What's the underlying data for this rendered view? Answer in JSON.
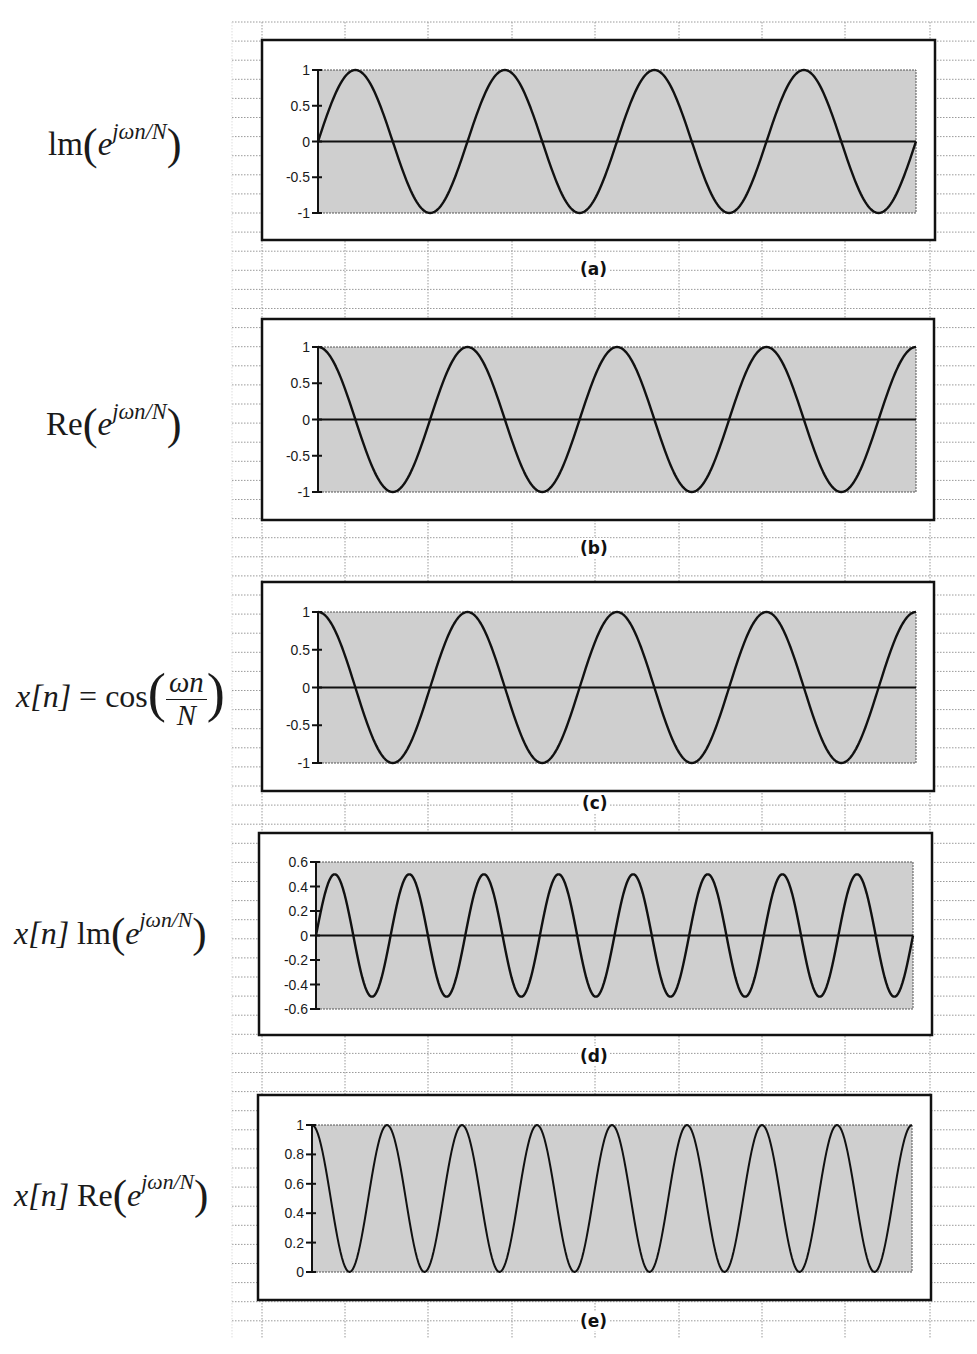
{
  "figure": {
    "background": "spreadsheet-grid",
    "colors": {
      "plot_fill": "#cfcfcf",
      "line": "#111111",
      "frame": "#111111",
      "grid": "#9a9a9a"
    }
  },
  "panels": [
    {
      "id": "a",
      "panel_label": "(a)",
      "formula": {
        "prefix": "",
        "func": "lm",
        "base": "e",
        "exponent": "jωn/N"
      },
      "yticks": [
        "1",
        "0.5",
        "0",
        "-0.5",
        "-1"
      ]
    },
    {
      "id": "b",
      "panel_label": "(b)",
      "formula": {
        "prefix": "",
        "func": "Re",
        "base": "e",
        "exponent": "jωn/N"
      },
      "yticks": [
        "1",
        "0.5",
        "0",
        "-0.5",
        "-1"
      ]
    },
    {
      "id": "c",
      "panel_label": "(c)",
      "formula": {
        "lhs": "x[n]",
        "eq": "=",
        "func": "cos",
        "num": "ωn",
        "den": "N"
      },
      "yticks": [
        "1",
        "0.5",
        "0",
        "-0.5",
        "-1"
      ]
    },
    {
      "id": "d",
      "panel_label": "(d)",
      "formula": {
        "prefix": "x[n]",
        "func": "lm",
        "base": "e",
        "exponent": "jωn/N"
      },
      "yticks": [
        "0.6",
        "0.4",
        "0.2",
        "0",
        "-0.2",
        "-0.4",
        "-0.6"
      ]
    },
    {
      "id": "e",
      "panel_label": "(e)",
      "formula": {
        "prefix": "x[n]",
        "func": "Re",
        "base": "e",
        "exponent": "jωn/N"
      },
      "yticks": [
        "1",
        "0.8",
        "0.6",
        "0.4",
        "0.2",
        "0"
      ]
    }
  ],
  "chart_data": [
    {
      "type": "line",
      "title": "(a)",
      "ylabel": "Im(e^{jωn/N})",
      "xlabel": "",
      "function": "sin",
      "cycles": 4,
      "amplitude": 1,
      "offset": 0,
      "ylim": [
        -1,
        1
      ],
      "yticks": [
        1,
        0.5,
        0,
        -0.5,
        -1
      ],
      "zero_line": true,
      "grid": false
    },
    {
      "type": "line",
      "title": "(b)",
      "ylabel": "Re(e^{jωn/N})",
      "xlabel": "",
      "function": "cos",
      "cycles": 4,
      "amplitude": 1,
      "offset": 0,
      "ylim": [
        -1,
        1
      ],
      "yticks": [
        1,
        0.5,
        0,
        -0.5,
        -1
      ],
      "zero_line": true,
      "grid": false
    },
    {
      "type": "line",
      "title": "(c)",
      "ylabel": "x[n] = cos(ωn/N)",
      "xlabel": "",
      "function": "cos",
      "cycles": 4,
      "amplitude": 1,
      "offset": 0,
      "ylim": [
        -1,
        1
      ],
      "yticks": [
        1,
        0.5,
        0,
        -0.5,
        -1
      ],
      "zero_line": true,
      "grid": false
    },
    {
      "type": "line",
      "title": "(d)",
      "ylabel": "x[n] Im(e^{jωn/N})",
      "xlabel": "",
      "function": "sin",
      "cycles": 8,
      "amplitude": 0.5,
      "offset": 0,
      "ylim": [
        -0.6,
        0.6
      ],
      "yticks": [
        0.6,
        0.4,
        0.2,
        0,
        -0.2,
        -0.4,
        -0.6
      ],
      "zero_line": true,
      "grid": false
    },
    {
      "type": "line",
      "title": "(e)",
      "ylabel": "x[n] Re(e^{jωn/N})",
      "xlabel": "",
      "function": "cos",
      "cycles": 8,
      "amplitude": 0.5,
      "offset": 0.5,
      "ylim": [
        0,
        1
      ],
      "yticks": [
        1,
        0.8,
        0.6,
        0.4,
        0.2,
        0
      ],
      "zero_line": false,
      "grid": false
    }
  ]
}
